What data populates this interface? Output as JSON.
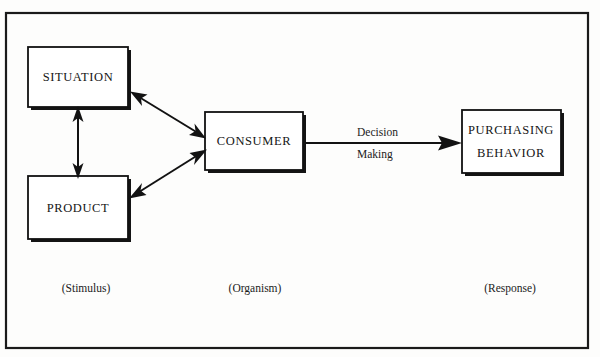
{
  "diagram": {
    "frame": {
      "name": "outer-border"
    },
    "colors": {
      "background": "#fdfdfc",
      "line": "#121212",
      "box_fill": "#ffffff",
      "box_stroke": "#111111",
      "text": "#151515"
    },
    "nodes": [
      {
        "id": "situation",
        "label": "SITUATION"
      },
      {
        "id": "product",
        "label": "PRODUCT"
      },
      {
        "id": "consumer",
        "label": "CONSUMER"
      },
      {
        "id": "purchasing-behavior",
        "label_line1": "PURCHASING",
        "label_line2": "BEHAVIOR"
      }
    ],
    "edges": [
      {
        "id": "situation-product",
        "type": "double-arrow",
        "label": ""
      },
      {
        "id": "situation-consumer",
        "type": "double-arrow",
        "label": ""
      },
      {
        "id": "product-consumer",
        "type": "double-arrow",
        "label": ""
      },
      {
        "id": "consumer-purchasing",
        "type": "single-arrow",
        "label_line1": "Decision",
        "label_line2": "Making"
      }
    ],
    "zone_labels": [
      {
        "id": "stimulus",
        "text": "(Stimulus)"
      },
      {
        "id": "organism",
        "text": "(Organism)"
      },
      {
        "id": "response",
        "text": "(Response)"
      }
    ]
  }
}
